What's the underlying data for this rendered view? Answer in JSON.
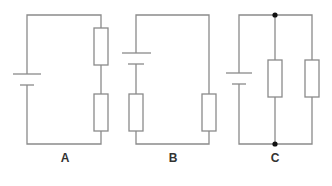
{
  "diagram": {
    "type": "circuit-diagrams",
    "colors": {
      "wire": "#8a8a8a",
      "junction": "#111111",
      "label": "#333333",
      "background": "#ffffff"
    },
    "circuits": [
      {
        "label": "A",
        "description": "Cell with two resistors in series",
        "label_pos": {
          "x": 65,
          "y": 151
        }
      },
      {
        "label": "B",
        "description": "Cell and two resistors in series (one each side)",
        "label_pos": {
          "x": 173,
          "y": 151
        }
      },
      {
        "label": "C",
        "description": "Cell with two resistors in parallel, junction dots",
        "label_pos": {
          "x": 275,
          "y": 151
        }
      }
    ]
  }
}
